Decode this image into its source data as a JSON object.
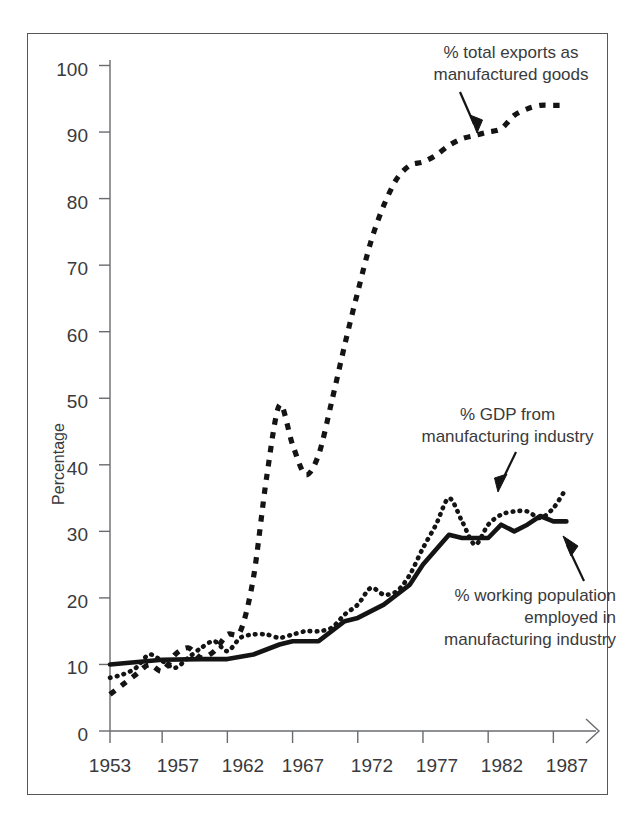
{
  "chart_data": {
    "type": "line",
    "title": "",
    "subtitle": "",
    "xlabel": "",
    "ylabel": "Percentage",
    "xlim": [
      1953,
      1988
    ],
    "ylim": [
      0,
      100
    ],
    "grid": false,
    "legend_position": "inline-annotations",
    "y_ticks": [
      "0",
      "10",
      "20",
      "30",
      "40",
      "50",
      "60",
      "70",
      "80",
      "90",
      "100"
    ],
    "y_tick_values": [
      0,
      10,
      20,
      30,
      40,
      50,
      60,
      70,
      80,
      90,
      100
    ],
    "x_ticks": [
      "1953",
      "1957",
      "1962",
      "1967",
      "1972",
      "1977",
      "1982",
      "1987"
    ],
    "x_tick_values": [
      1953,
      1957,
      1962,
      1967,
      1972,
      1977,
      1982,
      1987
    ],
    "annotations": [
      {
        "label": "% total exports as manufactured goods",
        "lines": [
          "% total exports as",
          "manufactured goods"
        ],
        "series": "exports",
        "target_x": 1984,
        "target_y": 90.5
      },
      {
        "label": "% GDP from manufacturing industry",
        "lines": [
          "% GDP from",
          "manufacturing industry"
        ],
        "series": "gdp",
        "target_x": 1984,
        "target_y": 36.5
      },
      {
        "label": "% working population employed in manufacturing industry",
        "lines": [
          "% working population",
          "employed in",
          "manufacturing industry"
        ],
        "series": "employment",
        "target_x": 1986,
        "target_y": 31.5
      }
    ],
    "series": [
      {
        "name": "% total exports as manufactured goods",
        "style": "dashed",
        "color": "#141414",
        "x": [
          1953,
          1954,
          1955,
          1956,
          1957,
          1958,
          1959,
          1960,
          1961,
          1962,
          1963,
          1964,
          1965,
          1966,
          1967,
          1968,
          1969,
          1970,
          1971,
          1972,
          1973,
          1974,
          1975,
          1976,
          1977,
          1978,
          1979,
          1980,
          1981,
          1982,
          1983,
          1984,
          1985,
          1986,
          1987,
          1988
        ],
        "y": [
          5.5,
          7.0,
          8.5,
          10.0,
          9.0,
          11.5,
          12.5,
          11.0,
          12.0,
          14.5,
          15.0,
          23.0,
          38.0,
          49.0,
          43.0,
          38.5,
          41.5,
          49.5,
          58.0,
          66.0,
          73.5,
          79.0,
          83.0,
          85.0,
          85.5,
          86.5,
          88.0,
          89.0,
          89.5,
          90.0,
          90.5,
          92.5,
          93.5,
          94.0,
          94.0,
          94.0
        ]
      },
      {
        "name": "% GDP from manufacturing industry",
        "style": "dotted",
        "color": "#141414",
        "x": [
          1953,
          1954,
          1955,
          1956,
          1957,
          1958,
          1959,
          1960,
          1961,
          1962,
          1963,
          1964,
          1965,
          1966,
          1967,
          1968,
          1969,
          1970,
          1971,
          1972,
          1973,
          1974,
          1975,
          1976,
          1977,
          1978,
          1979,
          1980,
          1981,
          1982,
          1983,
          1984,
          1985,
          1986,
          1987,
          1988
        ],
        "y": [
          8.0,
          8.5,
          9.5,
          11.5,
          10.5,
          9.5,
          11.0,
          12.5,
          13.5,
          12.0,
          14.0,
          14.5,
          14.5,
          14.0,
          14.5,
          15.0,
          15.0,
          15.5,
          17.5,
          19.0,
          21.5,
          20.5,
          21.0,
          23.5,
          27.5,
          31.0,
          35.0,
          31.5,
          28.0,
          31.0,
          32.5,
          33.0,
          33.0,
          32.0,
          33.5,
          36.5
        ]
      },
      {
        "name": "% working population employed in manufacturing industry",
        "style": "solid",
        "color": "#141414",
        "x": [
          1953,
          1957,
          1960,
          1962,
          1964,
          1966,
          1967,
          1969,
          1971,
          1972,
          1974,
          1976,
          1977,
          1979,
          1980,
          1982,
          1983,
          1984,
          1985,
          1986,
          1987,
          1988
        ],
        "y": [
          10.0,
          10.7,
          10.8,
          10.8,
          11.5,
          13.0,
          13.5,
          13.5,
          16.5,
          17.0,
          19.0,
          22.0,
          25.0,
          29.5,
          29.0,
          29.0,
          31.0,
          30.0,
          31.0,
          32.3,
          31.5,
          31.5
        ]
      }
    ],
    "series_endpoints": {
      "exports_end": 94,
      "gdp_end": 39,
      "employment_end": 31.5
    },
    "key_features": {
      "exports_peak_1962": 49,
      "exports_trough_1964": 38.5,
      "gdp_peak_1973": 35,
      "gdp_trough_1976": 28
    }
  },
  "axis": {
    "y_title": "Percentage"
  }
}
